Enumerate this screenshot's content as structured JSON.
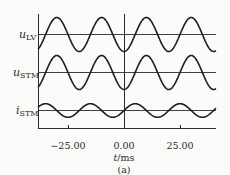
{
  "chart_data": {
    "type": "line",
    "title": "",
    "caption": "(a)",
    "xlabel": "t/ms",
    "ylabel": "",
    "x_ticks": [
      -25.0,
      0.0,
      25.0
    ],
    "x_tick_labels": [
      "-25.00",
      "0.00",
      "25.00"
    ],
    "xlim": [
      -37,
      42
    ],
    "grid": false,
    "vertical_marker_at": 0.0,
    "legend": "none (inline row labels on left)",
    "series": [
      {
        "name": "u_LV",
        "label_main": "u",
        "label_sub": "LV",
        "waveform": "sinusoid",
        "period_ms": 20,
        "relative_amplitude": 1.0,
        "value_at_t0": "minimum"
      },
      {
        "name": "u_STM",
        "label_main": "u",
        "label_sub": "STM",
        "waveform": "sinusoid",
        "period_ms": 20,
        "relative_amplitude": 1.0,
        "value_at_t0": "minimum"
      },
      {
        "name": "i_STM",
        "label_main": "i",
        "label_sub": "STM",
        "waveform": "sinusoid",
        "period_ms": 20,
        "relative_amplitude": 0.4,
        "value_at_t0": "zero crossing, rising"
      }
    ]
  },
  "labels": {
    "s0_main": "u",
    "s0_sub": "LV",
    "s1_main": "u",
    "s1_sub": "STM",
    "s2_main": "i",
    "s2_sub": "STM",
    "tick0": "−25.00",
    "tick1": "0.00",
    "tick2": "25.00",
    "xlabel_var": "t",
    "xlabel_unit": "/ms",
    "caption": "(a)"
  }
}
